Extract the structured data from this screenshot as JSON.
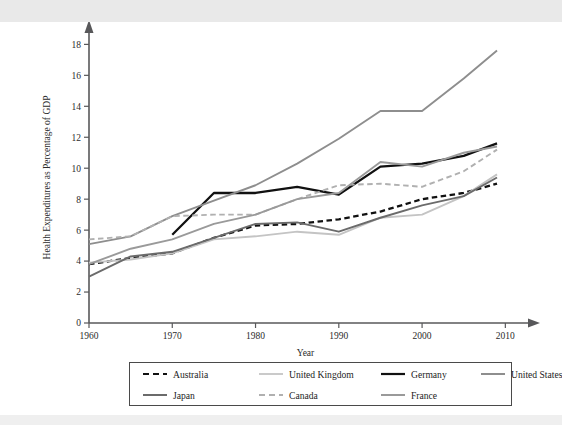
{
  "figure": {
    "background_color": "#ffffff",
    "frame_color": "#4a4a4a"
  },
  "axes": {
    "x_title": "Year",
    "y_title": "Health Expenditures as Percentage of GDP",
    "x_ticks": [
      "1960",
      "1970",
      "1980",
      "1990",
      "2000",
      "2010"
    ],
    "y_ticks": [
      "0",
      "2",
      "4",
      "6",
      "8",
      "10",
      "12",
      "14",
      "16",
      "18"
    ]
  },
  "legend": {
    "row1": [
      {
        "label": "Australia",
        "style": "dashed",
        "color": "#111111",
        "width": 2.2
      },
      {
        "label": "United Kingdom",
        "style": "solid",
        "color": "#c4c4c4",
        "width": 1.8
      },
      {
        "label": "Germany",
        "style": "solid",
        "color": "#111111",
        "width": 2.2
      },
      {
        "label": "United States",
        "style": "solid",
        "color": "#8e8e8e",
        "width": 2.0
      }
    ],
    "row2": [
      {
        "label": "Japan",
        "style": "solid",
        "color": "#6b6b6b",
        "width": 2.0
      },
      {
        "label": "Canada",
        "style": "dashed",
        "color": "#b0b0b0",
        "width": 2.2
      },
      {
        "label": "France",
        "style": "solid",
        "color": "#9a9a9a",
        "width": 2.0
      }
    ]
  },
  "chart_data": {
    "type": "line",
    "title": "",
    "xlabel": "Year",
    "ylabel": "Health Expenditures as Percentage of GDP",
    "xlim": [
      1960,
      2012
    ],
    "ylim": [
      0,
      18.8
    ],
    "xticks": [
      1960,
      1970,
      1980,
      1990,
      2000,
      2010
    ],
    "yticks": [
      0,
      2,
      4,
      6,
      8,
      10,
      12,
      14,
      16,
      18
    ],
    "grid": false,
    "legend_position": "below-axes",
    "series": [
      {
        "name": "Australia",
        "style": "dashed",
        "color": "#111111",
        "x": [
          1960,
          1965,
          1970,
          1975,
          1980,
          1985,
          1990,
          1995,
          2000,
          2005,
          2009
        ],
        "y": [
          3.8,
          4.2,
          4.5,
          5.5,
          6.3,
          6.4,
          6.7,
          7.2,
          8.0,
          8.4,
          9.0
        ]
      },
      {
        "name": "United Kingdom",
        "style": "solid",
        "color": "#c4c4c4",
        "x": [
          1960,
          1965,
          1970,
          1975,
          1980,
          1985,
          1990,
          1995,
          2000,
          2005,
          2009
        ],
        "y": [
          3.9,
          4.1,
          4.5,
          5.4,
          5.6,
          5.9,
          5.7,
          6.8,
          7.0,
          8.2,
          9.6
        ]
      },
      {
        "name": "Germany",
        "style": "solid",
        "color": "#111111",
        "x": [
          1970,
          1975,
          1980,
          1985,
          1990,
          1995,
          2000,
          2005,
          2009
        ],
        "y": [
          5.7,
          8.4,
          8.4,
          8.8,
          8.3,
          10.1,
          10.3,
          10.8,
          11.6
        ]
      },
      {
        "name": "United States",
        "style": "solid",
        "color": "#8e8e8e",
        "x": [
          1960,
          1965,
          1970,
          1975,
          1980,
          1985,
          1990,
          1995,
          2000,
          2005,
          2009
        ],
        "y": [
          5.1,
          5.6,
          6.9,
          7.9,
          8.9,
          10.3,
          11.9,
          13.7,
          13.7,
          15.8,
          17.6
        ]
      },
      {
        "name": "Japan",
        "style": "solid",
        "color": "#6b6b6b",
        "x": [
          1960,
          1965,
          1970,
          1975,
          1980,
          1985,
          1990,
          1995,
          2000,
          2005,
          2009
        ],
        "y": [
          3.0,
          4.3,
          4.6,
          5.5,
          6.4,
          6.5,
          5.9,
          6.8,
          7.6,
          8.2,
          9.4
        ]
      },
      {
        "name": "Canada",
        "style": "dashed",
        "color": "#b0b0b0",
        "x": [
          1960,
          1965,
          1970,
          1975,
          1980,
          1985,
          1990,
          1995,
          2000,
          2005,
          2009
        ],
        "y": [
          5.4,
          5.6,
          6.9,
          7.0,
          7.0,
          8.0,
          8.9,
          9.0,
          8.8,
          9.8,
          11.2
        ]
      },
      {
        "name": "France",
        "style": "solid",
        "color": "#9a9a9a",
        "x": [
          1960,
          1965,
          1970,
          1975,
          1980,
          1985,
          1990,
          1995,
          2000,
          2005,
          2009
        ],
        "y": [
          3.8,
          4.8,
          5.4,
          6.4,
          7.0,
          8.0,
          8.4,
          10.4,
          10.1,
          11.0,
          11.4
        ]
      }
    ]
  }
}
